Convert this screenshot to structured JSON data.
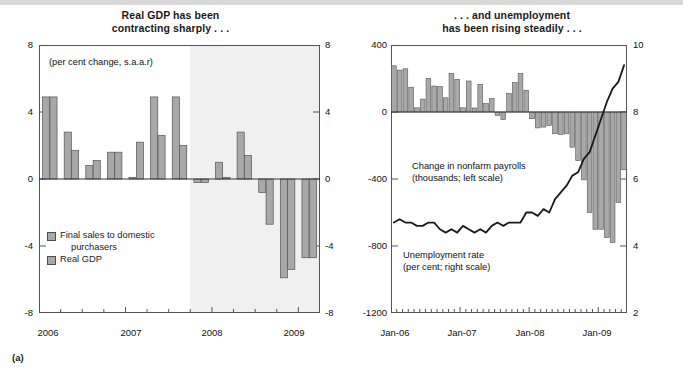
{
  "figure": {
    "label": "(a)"
  },
  "panels": [
    {
      "id": "left",
      "title_line1": "Real GDP has been",
      "title_line2": "contracting sharply . . .",
      "units_note": "(per cent change, s.a.a.r)",
      "legend": [
        {
          "name": "Final sales to domestic",
          "cont": "purchasers",
          "color": "#a8a8a8"
        },
        {
          "name": "Real GDP",
          "cont": "",
          "color": "#a8a8a8"
        }
      ]
    },
    {
      "id": "right",
      "title_line1": ". . . and unemployment",
      "title_line2": "has been rising steadily . . .",
      "note_payrolls_l1": "Change in nonfarm payrolls",
      "note_payrolls_l2": "(thousands; left scale)",
      "note_unemp_l1": "Unemployment rate",
      "note_unemp_l2": "(per cent; right scale)"
    }
  ],
  "chart_data": [
    {
      "id": "gdp-chart",
      "type": "bar",
      "title": "Real GDP has been contracting sharply . . .",
      "subtitle": "(per cent change, s.a.a.r)",
      "xlabel": "",
      "ylabel": "(per cent change, s.a.a.r)",
      "ylim": [
        -8,
        8
      ],
      "yticks": [
        -8,
        -4,
        0,
        4,
        8
      ],
      "ytick_labels_left": [
        "-8",
        "-4",
        "0",
        "4",
        "8"
      ],
      "ytick_labels_right": [
        "-8",
        "-4",
        "0",
        "4",
        "8"
      ],
      "grid": false,
      "legend_position": "inside-lower-left",
      "categories": [
        "2006Q1",
        "2006Q2",
        "2006Q3",
        "2006Q4",
        "2007Q1",
        "2007Q2",
        "2007Q3",
        "2007Q4",
        "2008Q1",
        "2008Q2",
        "2008Q3",
        "2008Q4",
        "2009Q1"
      ],
      "xtick_labels": [
        "2006",
        "2007",
        "2008",
        "2009"
      ],
      "xtick_positions": [
        0,
        4,
        8,
        12
      ],
      "shaded_region": {
        "from_category": "2007Q4",
        "to_end": true,
        "color": "#f0f0f0",
        "note": "recession shading"
      },
      "series": [
        {
          "name": "Final sales to domestic purchasers",
          "color": "#a8a8a8",
          "values": [
            4.9,
            2.8,
            0.8,
            1.6,
            0.1,
            4.9,
            4.9,
            -0.2,
            1.0,
            2.8,
            -0.8,
            -5.9,
            -4.7
          ]
        },
        {
          "name": "Real GDP",
          "color": "#a8a8a8",
          "values": [
            4.9,
            1.7,
            1.1,
            1.6,
            2.2,
            2.6,
            2.0,
            -0.2,
            0.1,
            1.4,
            -2.7,
            -5.4,
            -4.7
          ]
        }
      ]
    },
    {
      "id": "labour-chart",
      "type": "bar+line",
      "title": ". . . and unemployment has been rising steadily . . .",
      "xlabel": "",
      "ylabel_left": "Change in nonfarm payrolls (thousands; left scale)",
      "ylabel_right": "Unemployment rate (per cent; right scale)",
      "ylim_left": [
        -1200,
        400
      ],
      "yticks_left": [
        -1200,
        -800,
        -400,
        0,
        400
      ],
      "ytick_labels_left": [
        "-1200",
        "-800",
        "-400",
        "0",
        "400"
      ],
      "ylim_right": [
        2,
        10
      ],
      "yticks_right": [
        2,
        4,
        6,
        8,
        10
      ],
      "ytick_labels_right": [
        "2",
        "4",
        "6",
        "8",
        "10"
      ],
      "grid": false,
      "xtick_labels": [
        "Jan-06",
        "Jan-07",
        "Jan-08",
        "Jan-09"
      ],
      "xtick_positions": [
        0,
        12,
        24,
        36
      ],
      "x": [
        "Jan-06",
        "Feb-06",
        "Mar-06",
        "Apr-06",
        "May-06",
        "Jun-06",
        "Jul-06",
        "Aug-06",
        "Sep-06",
        "Oct-06",
        "Nov-06",
        "Dec-06",
        "Jan-07",
        "Feb-07",
        "Mar-07",
        "Apr-07",
        "May-07",
        "Jun-07",
        "Jul-07",
        "Aug-07",
        "Sep-07",
        "Oct-07",
        "Nov-07",
        "Dec-07",
        "Jan-08",
        "Feb-08",
        "Mar-08",
        "Apr-08",
        "May-08",
        "Jun-08",
        "Jul-08",
        "Aug-08",
        "Sep-08",
        "Oct-08",
        "Nov-08",
        "Dec-08",
        "Jan-09",
        "Feb-09",
        "Mar-09",
        "Apr-09",
        "May-09"
      ],
      "series": [
        {
          "name": "Change in nonfarm payrolls",
          "type": "bar",
          "color": "#a8a8a8",
          "axis": "left",
          "values": [
            276,
            250,
            258,
            148,
            25,
            77,
            200,
            155,
            152,
            85,
            230,
            195,
            25,
            185,
            24,
            165,
            50,
            80,
            -20,
            -45,
            110,
            175,
            230,
            130,
            -40,
            -95,
            -90,
            -80,
            -130,
            -135,
            -130,
            -210,
            -290,
            -405,
            -600,
            -700,
            -700,
            -750,
            -780,
            -540,
            -345
          ]
        },
        {
          "name": "Unemployment rate",
          "type": "line",
          "color": "#1a1a1a",
          "axis": "right",
          "values": [
            4.7,
            4.8,
            4.7,
            4.7,
            4.6,
            4.6,
            4.7,
            4.7,
            4.5,
            4.4,
            4.5,
            4.4,
            4.6,
            4.5,
            4.4,
            4.5,
            4.4,
            4.6,
            4.7,
            4.6,
            4.7,
            4.7,
            4.7,
            5.0,
            5.0,
            4.9,
            5.1,
            5.0,
            5.4,
            5.6,
            5.8,
            6.1,
            6.2,
            6.6,
            6.8,
            7.3,
            7.8,
            8.3,
            8.7,
            8.9,
            9.4
          ]
        }
      ]
    }
  ]
}
